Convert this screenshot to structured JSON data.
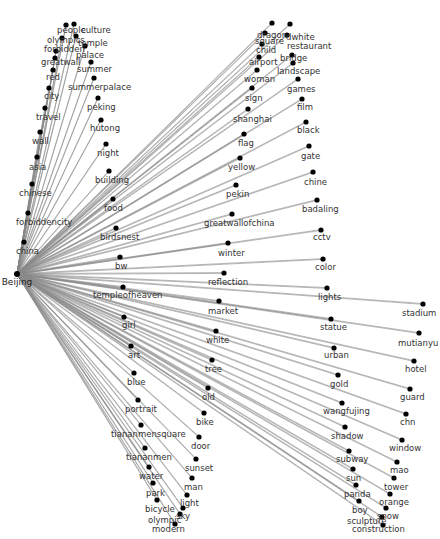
{
  "diagram": {
    "type": "star-network",
    "hub": {
      "id": "Beijing",
      "label": "Beijing",
      "x": 17,
      "y": 274,
      "lx": 17,
      "ly": 285
    },
    "edge_color": "#8a8a8a",
    "node_color": "#000000",
    "nodes": [
      {
        "label": "people",
        "x": 66,
        "y": 25,
        "lx": 57,
        "ly": 33
      },
      {
        "label": "culture",
        "x": 74,
        "y": 24,
        "lx": 81,
        "ly": 33
      },
      {
        "label": "olympics",
        "x": 62,
        "y": 38,
        "lx": 47,
        "ly": 43
      },
      {
        "label": "temple",
        "x": 76,
        "y": 36,
        "lx": 78,
        "ly": 46
      },
      {
        "label": "forbidden",
        "x": 56,
        "y": 51,
        "lx": 44,
        "ly": 52
      },
      {
        "label": "palace",
        "x": 85,
        "y": 46,
        "lx": 76,
        "ly": 58
      },
      {
        "label": "greatwall",
        "x": 55,
        "y": 58,
        "lx": 41,
        "ly": 65
      },
      {
        "label": "summer",
        "x": 91,
        "y": 62,
        "lx": 77,
        "ly": 72
      },
      {
        "label": "red",
        "x": 53,
        "y": 70,
        "lx": 46,
        "ly": 80
      },
      {
        "label": "summerpalace",
        "x": 94,
        "y": 78,
        "lx": 68,
        "ly": 90
      },
      {
        "label": "city",
        "x": 49,
        "y": 88,
        "lx": 44,
        "ly": 99
      },
      {
        "label": "peking",
        "x": 98,
        "y": 98,
        "lx": 87,
        "ly": 110
      },
      {
        "label": "travel",
        "x": 45,
        "y": 108,
        "lx": 36,
        "ly": 120
      },
      {
        "label": "hutong",
        "x": 101,
        "y": 120,
        "lx": 90,
        "ly": 131
      },
      {
        "label": "wall",
        "x": 40,
        "y": 132,
        "lx": 32,
        "ly": 144
      },
      {
        "label": "night",
        "x": 106,
        "y": 144,
        "lx": 97,
        "ly": 156
      },
      {
        "label": "asia",
        "x": 37,
        "y": 157,
        "lx": 29,
        "ly": 170
      },
      {
        "label": "building",
        "x": 109,
        "y": 171,
        "lx": 95,
        "ly": 183
      },
      {
        "label": "chinese",
        "x": 32,
        "y": 184,
        "lx": 19,
        "ly": 196
      },
      {
        "label": "food",
        "x": 113,
        "y": 199,
        "lx": 104,
        "ly": 211
      },
      {
        "label": "forbiddencity",
        "x": 28,
        "y": 213,
        "lx": 16,
        "ly": 225
      },
      {
        "label": "birdsnest",
        "x": 116,
        "y": 228,
        "lx": 100,
        "ly": 240
      },
      {
        "label": "china",
        "x": 24,
        "y": 242,
        "lx": 16,
        "ly": 254
      },
      {
        "label": "bw",
        "x": 120,
        "y": 257,
        "lx": 115,
        "ly": 269
      },
      {
        "label": "dragon",
        "x": 272,
        "y": 23,
        "lx": 257,
        "ly": 38
      },
      {
        "label": "dwhite",
        "x": 290,
        "y": 24,
        "lx": 286,
        "ly": 40
      },
      {
        "label": "square",
        "x": 265,
        "y": 33,
        "lx": 255,
        "ly": 44
      },
      {
        "label": "restaurant",
        "x": 287,
        "y": 35,
        "lx": 287,
        "ly": 49
      },
      {
        "label": "child",
        "x": 262,
        "y": 44,
        "lx": 256,
        "ly": 53
      },
      {
        "label": "bridge",
        "x": 292,
        "y": 55,
        "lx": 280,
        "ly": 61
      },
      {
        "label": "airport",
        "x": 259,
        "y": 57,
        "lx": 249,
        "ly": 65
      },
      {
        "label": "landscape",
        "x": 293,
        "y": 63,
        "lx": 277,
        "ly": 74
      },
      {
        "label": "woman",
        "x": 257,
        "y": 70,
        "lx": 244,
        "ly": 82
      },
      {
        "label": "games",
        "x": 298,
        "y": 79,
        "lx": 287,
        "ly": 92
      },
      {
        "label": "sign",
        "x": 252,
        "y": 88,
        "lx": 245,
        "ly": 101
      },
      {
        "label": "film",
        "x": 302,
        "y": 99,
        "lx": 297,
        "ly": 110
      },
      {
        "label": "shanghai",
        "x": 248,
        "y": 109,
        "lx": 233,
        "ly": 122
      },
      {
        "label": "black",
        "x": 306,
        "y": 122,
        "lx": 297,
        "ly": 133
      },
      {
        "label": "flag",
        "x": 244,
        "y": 134,
        "lx": 238,
        "ly": 146
      },
      {
        "label": "gate",
        "x": 309,
        "y": 146,
        "lx": 301,
        "ly": 159
      },
      {
        "label": "yellow",
        "x": 240,
        "y": 158,
        "lx": 228,
        "ly": 170
      },
      {
        "label": "chine",
        "x": 313,
        "y": 172,
        "lx": 304,
        "ly": 185
      },
      {
        "label": "pekin",
        "x": 236,
        "y": 185,
        "lx": 226,
        "ly": 197
      },
      {
        "label": "badaling",
        "x": 317,
        "y": 200,
        "lx": 302,
        "ly": 212
      },
      {
        "label": "greatwallofchina",
        "x": 232,
        "y": 214,
        "lx": 204,
        "ly": 226
      },
      {
        "label": "cctv",
        "x": 321,
        "y": 230,
        "lx": 313,
        "ly": 240
      },
      {
        "label": "winter",
        "x": 228,
        "y": 243,
        "lx": 218,
        "ly": 256
      },
      {
        "label": "color",
        "x": 323,
        "y": 259,
        "lx": 315,
        "ly": 270
      },
      {
        "label": "reflection",
        "x": 224,
        "y": 273,
        "lx": 208,
        "ly": 285
      },
      {
        "label": "lights",
        "x": 327,
        "y": 288,
        "lx": 318,
        "ly": 300
      },
      {
        "label": "stadium",
        "x": 423,
        "y": 304,
        "lx": 402,
        "ly": 316
      },
      {
        "label": "templeofheaven",
        "x": 123,
        "y": 287,
        "lx": 93,
        "ly": 298
      },
      {
        "label": "market",
        "x": 219,
        "y": 301,
        "lx": 208,
        "ly": 314
      },
      {
        "label": "statue",
        "x": 331,
        "y": 319,
        "lx": 320,
        "ly": 330
      },
      {
        "label": "mutianyu",
        "x": 419,
        "y": 333,
        "lx": 398,
        "ly": 346
      },
      {
        "label": "girl",
        "x": 124,
        "y": 317,
        "lx": 122,
        "ly": 328
      },
      {
        "label": "white",
        "x": 216,
        "y": 331,
        "lx": 206,
        "ly": 343
      },
      {
        "label": "urban",
        "x": 334,
        "y": 348,
        "lx": 324,
        "ly": 358
      },
      {
        "label": "hotel",
        "x": 414,
        "y": 361,
        "lx": 405,
        "ly": 372
      },
      {
        "label": "art",
        "x": 131,
        "y": 346,
        "lx": 128,
        "ly": 358
      },
      {
        "label": "tree",
        "x": 212,
        "y": 360,
        "lx": 205,
        "ly": 372
      },
      {
        "label": "gold",
        "x": 338,
        "y": 375,
        "lx": 330,
        "ly": 387
      },
      {
        "label": "guard",
        "x": 410,
        "y": 389,
        "lx": 400,
        "ly": 400
      },
      {
        "label": "blue",
        "x": 134,
        "y": 373,
        "lx": 127,
        "ly": 385
      },
      {
        "label": "old",
        "x": 208,
        "y": 388,
        "lx": 202,
        "ly": 400
      },
      {
        "label": "wangfujing",
        "x": 342,
        "y": 403,
        "lx": 323,
        "ly": 414
      },
      {
        "label": "chn",
        "x": 406,
        "y": 414,
        "lx": 400,
        "ly": 425
      },
      {
        "label": "portrait",
        "x": 138,
        "y": 400,
        "lx": 125,
        "ly": 412
      },
      {
        "label": "bike",
        "x": 204,
        "y": 413,
        "lx": 196,
        "ly": 425
      },
      {
        "label": "shadow",
        "x": 345,
        "y": 427,
        "lx": 331,
        "ly": 439
      },
      {
        "label": "window",
        "x": 402,
        "y": 440,
        "lx": 389,
        "ly": 451
      },
      {
        "label": "tiananmensquare",
        "x": 141,
        "y": 425,
        "lx": 111,
        "ly": 437
      },
      {
        "label": "door",
        "x": 199,
        "y": 437,
        "lx": 191,
        "ly": 449
      },
      {
        "label": "subway",
        "x": 349,
        "y": 451,
        "lx": 336,
        "ly": 462
      },
      {
        "label": "mao",
        "x": 397,
        "y": 462,
        "lx": 390,
        "ly": 473
      },
      {
        "label": "tiananmen",
        "x": 145,
        "y": 448,
        "lx": 126,
        "ly": 460
      },
      {
        "label": "sunset",
        "x": 196,
        "y": 459,
        "lx": 185,
        "ly": 471
      },
      {
        "label": "sun",
        "x": 353,
        "y": 469,
        "lx": 346,
        "ly": 481
      },
      {
        "label": "tower",
        "x": 394,
        "y": 478,
        "lx": 384,
        "ly": 490
      },
      {
        "label": "water",
        "x": 149,
        "y": 467,
        "lx": 139,
        "ly": 479
      },
      {
        "label": "man",
        "x": 192,
        "y": 478,
        "lx": 184,
        "ly": 490
      },
      {
        "label": "panda",
        "x": 356,
        "y": 485,
        "lx": 344,
        "ly": 497
      },
      {
        "label": "orange",
        "x": 390,
        "y": 494,
        "lx": 379,
        "ly": 505
      },
      {
        "label": "park",
        "x": 153,
        "y": 483,
        "lx": 146,
        "ly": 496
      },
      {
        "label": "light",
        "x": 187,
        "y": 495,
        "lx": 180,
        "ly": 506
      },
      {
        "label": "boy",
        "x": 359,
        "y": 501,
        "lx": 352,
        "ly": 513
      },
      {
        "label": "snow",
        "x": 386,
        "y": 508,
        "lx": 377,
        "ly": 519
      },
      {
        "label": "bicycle",
        "x": 157,
        "y": 500,
        "lx": 145,
        "ly": 512
      },
      {
        "label": "sky",
        "x": 183,
        "y": 508,
        "lx": 176,
        "ly": 519
      },
      {
        "label": "sculpture",
        "x": 382,
        "y": 517,
        "lx": 347,
        "ly": 524
      },
      {
        "label": "olympic",
        "x": 180,
        "y": 514,
        "lx": 148,
        "ly": 523
      },
      {
        "label": "construction",
        "x": 383,
        "y": 525,
        "lx": 352,
        "ly": 532
      },
      {
        "label": "modern",
        "x": 175,
        "y": 524,
        "lx": 152,
        "ly": 532
      }
    ]
  }
}
